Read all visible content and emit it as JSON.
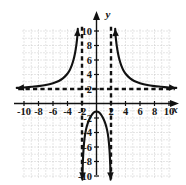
{
  "figure": {
    "name": "rational-function-graph",
    "background_color": "#ffffff",
    "ink_color": "#111111",
    "grid_color": "#bdbdbd"
  },
  "axes": {
    "x_axis_label": "x",
    "y_axis_label": "y",
    "x_ticks": [
      "-10",
      "-8",
      "-6",
      "-4",
      "-2",
      "2",
      "4",
      "6",
      "8",
      "10"
    ],
    "x_tick_values": [
      -10,
      -8,
      -6,
      -4,
      -2,
      2,
      4,
      6,
      8,
      10
    ],
    "y_ticks": [
      "10",
      "8",
      "6",
      "4",
      "2",
      "-2",
      "-4",
      "-6",
      "-8",
      "-10"
    ],
    "y_tick_values": [
      10,
      8,
      6,
      4,
      2,
      -2,
      -4,
      -6,
      -8,
      -10
    ],
    "x_minus_sign": "-"
  },
  "chart_data": {
    "type": "line",
    "title": "",
    "subtitle": "",
    "xlabel": "x",
    "ylabel": "y",
    "xlim": [
      -11.5,
      11.5
    ],
    "ylim": [
      -11.5,
      11.5
    ],
    "xticks": [
      -10,
      -8,
      -6,
      -4,
      -2,
      2,
      4,
      6,
      8,
      10
    ],
    "yticks": [
      10,
      8,
      6,
      4,
      2,
      -2,
      -4,
      -6,
      -8,
      -10
    ],
    "grid": true,
    "grid_style": "dotted",
    "grid_spacing": 1,
    "legend": "none",
    "asymptotes": [
      {
        "name": "vertical-asymptote-left",
        "type": "vertical",
        "value": -2,
        "style": "dashed"
      },
      {
        "name": "vertical-asymptote-right",
        "type": "vertical",
        "value": 2,
        "style": "dashed"
      },
      {
        "name": "horizontal-asymptote",
        "type": "horizontal",
        "value": 2,
        "style": "dashed"
      }
    ],
    "series": [
      {
        "name": "left-branch",
        "arrow_start": true,
        "arrow_end": true,
        "points": [
          [
            -11.0,
            2.15
          ],
          [
            -10.0,
            2.2
          ],
          [
            -9.0,
            2.3
          ],
          [
            -8.0,
            2.4
          ],
          [
            -7.0,
            2.55
          ],
          [
            -6.0,
            2.8
          ],
          [
            -5.2,
            3.1
          ],
          [
            -4.6,
            3.5
          ],
          [
            -4.1,
            4.0
          ],
          [
            -3.7,
            4.6
          ],
          [
            -3.4,
            5.3
          ],
          [
            -3.15,
            6.1
          ],
          [
            -2.95,
            7.0
          ],
          [
            -2.8,
            7.9
          ],
          [
            -2.7,
            8.7
          ],
          [
            -2.62,
            9.5
          ],
          [
            -2.58,
            10.3
          ]
        ]
      },
      {
        "name": "right-branch",
        "arrow_start": true,
        "arrow_end": true,
        "points": [
          [
            11.0,
            2.15
          ],
          [
            10.0,
            2.2
          ],
          [
            9.0,
            2.3
          ],
          [
            8.0,
            2.4
          ],
          [
            7.0,
            2.55
          ],
          [
            6.0,
            2.8
          ],
          [
            5.2,
            3.1
          ],
          [
            4.6,
            3.5
          ],
          [
            4.1,
            4.0
          ],
          [
            3.7,
            4.6
          ],
          [
            3.4,
            5.3
          ],
          [
            3.15,
            6.1
          ],
          [
            2.95,
            7.0
          ],
          [
            2.8,
            7.9
          ],
          [
            2.7,
            8.7
          ],
          [
            2.62,
            9.5
          ],
          [
            2.58,
            10.3
          ]
        ]
      },
      {
        "name": "middle-branch",
        "arrow_start": true,
        "arrow_end": true,
        "points": [
          [
            -1.95,
            -10.5
          ],
          [
            -1.9,
            -8.6
          ],
          [
            -1.8,
            -6.5
          ],
          [
            -1.65,
            -4.8
          ],
          [
            -1.45,
            -3.6
          ],
          [
            -1.2,
            -2.7
          ],
          [
            -0.9,
            -2.0
          ],
          [
            -0.6,
            -1.5
          ],
          [
            -0.3,
            -1.2
          ],
          [
            0.0,
            -1.1
          ],
          [
            0.3,
            -1.2
          ],
          [
            0.6,
            -1.5
          ],
          [
            0.9,
            -2.0
          ],
          [
            1.2,
            -2.7
          ],
          [
            1.45,
            -3.6
          ],
          [
            1.65,
            -4.8
          ],
          [
            1.8,
            -6.5
          ],
          [
            1.9,
            -8.6
          ],
          [
            1.95,
            -10.5
          ]
        ]
      }
    ]
  }
}
